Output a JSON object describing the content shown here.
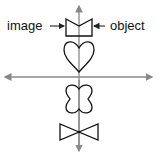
{
  "diagram": {
    "type": "reflection-symmetry",
    "labels": {
      "left": "image",
      "right": "object"
    },
    "colors": {
      "axis": "#888888",
      "shape": "#111111",
      "background": "#ffffff"
    },
    "shapes": [
      "box-with-v-notch",
      "heart",
      "four-lobed-clover",
      "bowtie"
    ]
  }
}
